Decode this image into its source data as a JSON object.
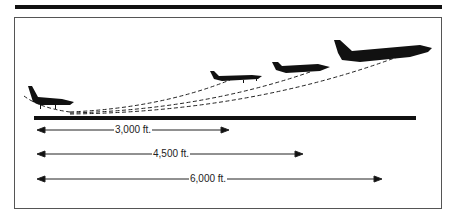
{
  "figure": {
    "title": "",
    "runway": {
      "label": "runway"
    },
    "aircraft": [
      {
        "name": "small-single-engine",
        "role": "light airplane"
      },
      {
        "name": "light-twin",
        "role": "small airplane"
      },
      {
        "name": "business-jet",
        "role": "medium airplane"
      },
      {
        "name": "airliner",
        "role": "large airplane"
      }
    ],
    "distances": [
      {
        "label": "3,000 ft.",
        "value_ft": 3000
      },
      {
        "label": "4,500 ft.",
        "value_ft": 4500
      },
      {
        "label": "6,000 ft.",
        "value_ft": 6000
      }
    ],
    "colors": {
      "ink": "#111111",
      "frame": "#555555",
      "background": "#ffffff"
    }
  }
}
